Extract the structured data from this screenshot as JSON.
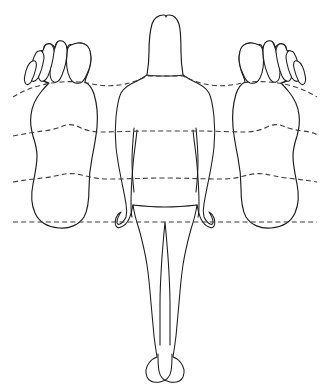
{
  "figure": {
    "title": "Reflexology foot-to-body zone correspondence chart",
    "background_color": "#ffffff",
    "outline_color": "#1a1a1a",
    "zone_line_color": "#3c3c3c",
    "width": 330,
    "height": 392
  },
  "body_figure": {
    "name": "human-body-outline",
    "view": "posterior",
    "description": "Standing human figure, back view, long hair, arms at sides",
    "parts": [
      {
        "label": "head-and-hair"
      },
      {
        "label": "torso"
      },
      {
        "label": "left-arm"
      },
      {
        "label": "right-arm"
      },
      {
        "label": "left-hand"
      },
      {
        "label": "right-hand"
      },
      {
        "label": "left-leg"
      },
      {
        "label": "right-leg"
      },
      {
        "label": "left-foot"
      },
      {
        "label": "right-foot"
      }
    ]
  },
  "left_foot": {
    "name": "left-foot-sole",
    "side": "left",
    "view": "plantar",
    "toe_count": 5,
    "toes": [
      "big-toe",
      "second-toe",
      "third-toe",
      "fourth-toe",
      "little-toe"
    ]
  },
  "right_foot": {
    "name": "right-foot-sole",
    "side": "right",
    "view": "plantar",
    "toe_count": 5,
    "toes": [
      "big-toe",
      "second-toe",
      "third-toe",
      "fourth-toe",
      "little-toe"
    ]
  },
  "zone_lines": [
    {
      "id": "line-1",
      "label": "shoulder-line",
      "y": 86,
      "style": "dashed",
      "shape": "curved"
    },
    {
      "id": "line-2",
      "label": "diaphragm-waist-line",
      "y": 131,
      "style": "dashed",
      "shape": "curved"
    },
    {
      "id": "line-3",
      "label": "waist-hip-line",
      "y": 178,
      "style": "dashed",
      "shape": "curved"
    },
    {
      "id": "line-4",
      "label": "pelvic-heel-line",
      "y": 222,
      "style": "dashed",
      "shape": "straight"
    }
  ],
  "chart_data": {
    "type": "diagram",
    "title": "Reflexology foot-to-body zone correspondence chart",
    "xlabel": "",
    "ylabel": "",
    "elements": [
      "left-foot-sole",
      "human-body-outline",
      "right-foot-sole"
    ],
    "guide_lines": [
      86,
      131,
      178,
      222
    ],
    "guide_line_labels": [
      "shoulder-line",
      "diaphragm-waist-line",
      "waist-hip-line",
      "pelvic-heel-line"
    ]
  }
}
